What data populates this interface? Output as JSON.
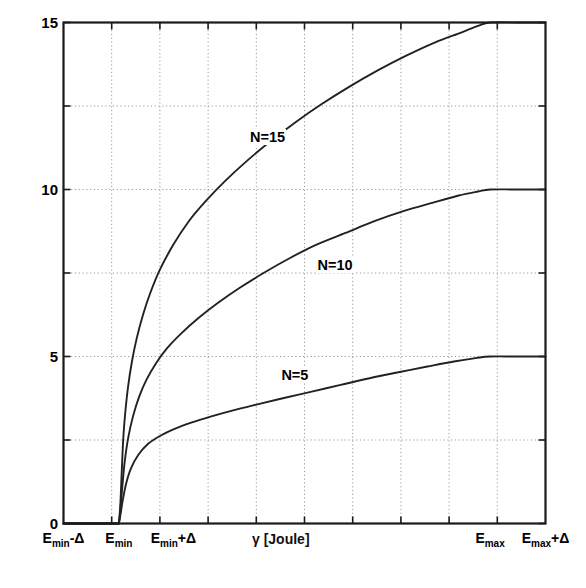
{
  "chart_data": {
    "type": "line",
    "title": "",
    "xlabel": "γ [Joule]",
    "ylabel": "The average number of participating CUs (N`)",
    "ylim": [
      0,
      15
    ],
    "yticks": [
      0,
      2.5,
      5,
      7.5,
      10,
      12.5,
      15
    ],
    "ytick_labels": [
      "0",
      "",
      "5",
      "",
      "10",
      "",
      "15"
    ],
    "xtick_labels": [
      {
        "text_main": "E",
        "text_sub": "min",
        "text_post": "-Δ",
        "pos": 0.0
      },
      {
        "text_main": "E",
        "text_sub": "min",
        "text_post": "",
        "pos": 0.115
      },
      {
        "text_main": "E",
        "text_sub": "min",
        "text_post": "+Δ",
        "pos": 0.228
      },
      {
        "text_main": "E",
        "text_sub": "max",
        "text_post": "",
        "pos": 0.885
      },
      {
        "text_main": "E",
        "text_sub": "max",
        "text_post": "+Δ",
        "pos": 1.0
      }
    ],
    "grid": true,
    "grid_style": "dotted",
    "legend_position": "inline-annotations",
    "series": [
      {
        "name": "N=15",
        "label": "N=15",
        "label_x": 0.385,
        "label_y": 11.55,
        "saturation_value": 15,
        "color": "#222222",
        "points": [
          [
            0.0,
            0.0
          ],
          [
            0.1,
            0.0
          ],
          [
            0.112,
            0.0
          ],
          [
            0.115,
            0.05
          ],
          [
            0.118,
            0.6
          ],
          [
            0.121,
            1.6
          ],
          [
            0.124,
            2.55
          ],
          [
            0.128,
            3.3
          ],
          [
            0.134,
            4.1
          ],
          [
            0.142,
            4.85
          ],
          [
            0.152,
            5.55
          ],
          [
            0.165,
            6.25
          ],
          [
            0.18,
            6.9
          ],
          [
            0.2,
            7.6
          ],
          [
            0.228,
            8.35
          ],
          [
            0.26,
            9.05
          ],
          [
            0.295,
            9.65
          ],
          [
            0.335,
            10.25
          ],
          [
            0.38,
            10.85
          ],
          [
            0.43,
            11.45
          ],
          [
            0.48,
            12.0
          ],
          [
            0.535,
            12.55
          ],
          [
            0.59,
            13.05
          ],
          [
            0.65,
            13.55
          ],
          [
            0.71,
            14.0
          ],
          [
            0.77,
            14.4
          ],
          [
            0.825,
            14.7
          ],
          [
            0.86,
            14.9
          ],
          [
            0.885,
            15.0
          ],
          [
            0.94,
            15.0
          ],
          [
            1.0,
            15.0
          ]
        ]
      },
      {
        "name": "N=10",
        "label": "N=10",
        "label_x": 0.525,
        "label_y": 7.7,
        "saturation_value": 10,
        "color": "#222222",
        "points": [
          [
            0.0,
            0.0
          ],
          [
            0.1,
            0.0
          ],
          [
            0.112,
            0.0
          ],
          [
            0.115,
            0.03
          ],
          [
            0.118,
            0.4
          ],
          [
            0.122,
            1.1
          ],
          [
            0.127,
            1.85
          ],
          [
            0.134,
            2.55
          ],
          [
            0.144,
            3.2
          ],
          [
            0.157,
            3.8
          ],
          [
            0.172,
            4.3
          ],
          [
            0.192,
            4.8
          ],
          [
            0.215,
            5.25
          ],
          [
            0.245,
            5.7
          ],
          [
            0.28,
            6.15
          ],
          [
            0.32,
            6.6
          ],
          [
            0.365,
            7.05
          ],
          [
            0.415,
            7.5
          ],
          [
            0.47,
            7.95
          ],
          [
            0.525,
            8.35
          ],
          [
            0.585,
            8.7
          ],
          [
            0.645,
            9.05
          ],
          [
            0.705,
            9.35
          ],
          [
            0.765,
            9.6
          ],
          [
            0.82,
            9.82
          ],
          [
            0.86,
            9.94
          ],
          [
            0.885,
            10.0
          ],
          [
            0.94,
            10.0
          ],
          [
            1.0,
            10.0
          ]
        ]
      },
      {
        "name": "N=5",
        "label": "N=5",
        "label_x": 0.45,
        "label_y": 4.42,
        "saturation_value": 5,
        "color": "#222222",
        "points": [
          [
            0.0,
            0.0
          ],
          [
            0.1,
            0.0
          ],
          [
            0.112,
            0.0
          ],
          [
            0.115,
            0.02
          ],
          [
            0.118,
            0.25
          ],
          [
            0.123,
            0.7
          ],
          [
            0.13,
            1.2
          ],
          [
            0.14,
            1.65
          ],
          [
            0.155,
            2.05
          ],
          [
            0.175,
            2.38
          ],
          [
            0.2,
            2.62
          ],
          [
            0.228,
            2.82
          ],
          [
            0.265,
            3.02
          ],
          [
            0.305,
            3.2
          ],
          [
            0.35,
            3.38
          ],
          [
            0.4,
            3.56
          ],
          [
            0.455,
            3.75
          ],
          [
            0.515,
            3.95
          ],
          [
            0.575,
            4.15
          ],
          [
            0.635,
            4.35
          ],
          [
            0.695,
            4.53
          ],
          [
            0.755,
            4.7
          ],
          [
            0.81,
            4.85
          ],
          [
            0.855,
            4.95
          ],
          [
            0.885,
            5.0
          ],
          [
            0.94,
            5.0
          ],
          [
            1.0,
            5.0
          ]
        ]
      }
    ],
    "axis_colors": {
      "frame": "#1a1a1a",
      "grid": "#999999",
      "curve": "#222222"
    }
  }
}
